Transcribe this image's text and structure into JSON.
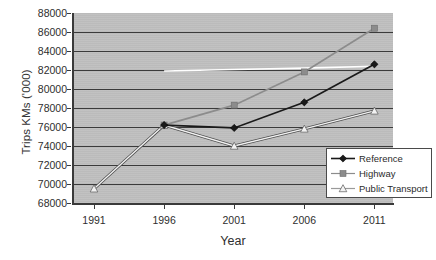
{
  "chart_data": {
    "type": "line",
    "title": "",
    "xlabel": "Year",
    "ylabel": "Trips KMs ('000)",
    "categories": [
      "1991",
      "1996",
      "2001",
      "2006",
      "2011"
    ],
    "x_tick_labels": [
      "1991",
      "1996",
      "2001",
      "2006",
      "2011"
    ],
    "y_tick_labels": [
      "88000",
      "86000",
      "84000",
      "82000",
      "80000",
      "78000",
      "76000",
      "74000",
      "72000",
      "70000",
      "68000"
    ],
    "ylim": [
      68000,
      88000
    ],
    "y_step": 2000,
    "grid": true,
    "legend_position": "bottom-right",
    "plot_background": "#bfbfbf",
    "gridline_color": "#3b3b3b",
    "series": [
      {
        "name": "Reference",
        "marker": "diamond",
        "color": "#1a1a1a",
        "in_legend": true,
        "values": [
          null,
          76200,
          75900,
          78600,
          82600
        ]
      },
      {
        "name": "Highway",
        "marker": "square",
        "color": "#8c8c8c",
        "in_legend": true,
        "values": [
          null,
          76200,
          78300,
          81800,
          86400
        ]
      },
      {
        "name": "Public Transport",
        "marker": "triangle",
        "color": "#f2f2f2",
        "in_legend": true,
        "values": [
          69500,
          76200,
          74000,
          75800,
          77700
        ]
      },
      {
        "name": "",
        "marker": "none",
        "color": "#ffffff",
        "in_legend": false,
        "values": [
          null,
          81900,
          82050,
          82200,
          82400
        ]
      }
    ]
  },
  "legend": {
    "items": [
      {
        "label": "Reference",
        "marker": "diamond",
        "color": "#1a1a1a"
      },
      {
        "label": "Highway",
        "marker": "square",
        "color": "#8c8c8c"
      },
      {
        "label": "Public Transport",
        "marker": "triangle",
        "color": "#f2f2f2"
      }
    ]
  }
}
